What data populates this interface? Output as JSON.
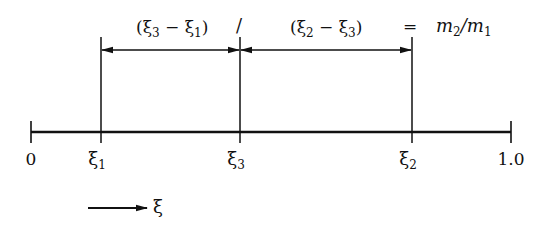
{
  "diagram": {
    "type": "lever-rule",
    "colors": {
      "ink": "#111111",
      "background": "#ffffff"
    },
    "axis": {
      "ticks": [
        {
          "id": "zero",
          "x": 31,
          "label": "0",
          "sub": ""
        },
        {
          "id": "xi1",
          "x": 101,
          "label": "ξ",
          "sub": "1"
        },
        {
          "id": "xi3",
          "x": 240,
          "label": "ξ",
          "sub": "3"
        },
        {
          "id": "xi2",
          "x": 412,
          "label": "ξ",
          "sub": "2"
        },
        {
          "id": "one",
          "x": 511,
          "label": "1.0",
          "sub": ""
        }
      ]
    },
    "equation": {
      "left_term": {
        "open": "(ξ",
        "sub_a": "3",
        "mid": " − ξ",
        "sub_b": "1",
        "close": ")"
      },
      "divide": "/",
      "right_term": {
        "open": "(ξ",
        "sub_a": "2",
        "mid": " − ξ",
        "sub_b": "3",
        "close": ")"
      },
      "equals": "=",
      "result": {
        "m_a": "m",
        "sub_a": "2",
        "slash": "/",
        "m_b": "m",
        "sub_b": "1"
      }
    },
    "direction_indicator": {
      "label": "ξ"
    }
  }
}
